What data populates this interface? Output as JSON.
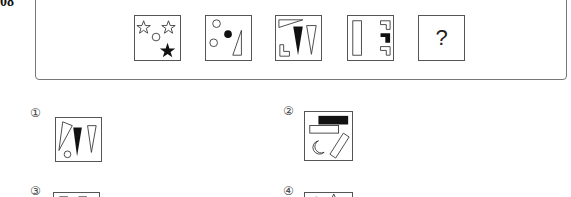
{
  "question": {
    "number": "08",
    "sequence": [
      {
        "id": 1,
        "description": "two outlined stars, one small circle, one filled star"
      },
      {
        "id": 2,
        "description": "two outlined circles, one filled circle, one outlined right triangle"
      },
      {
        "id": 3,
        "description": "outlined wedge triangle, filled tall triangle, outlined tall triangle, outlined L-shape"
      },
      {
        "id": 4,
        "description": "outlined tall rectangle, two outlined corner brackets, one filled corner bracket"
      },
      {
        "id": 5,
        "description": "unknown",
        "symbol": "?"
      }
    ]
  },
  "options": [
    {
      "label": "①",
      "description": "outlined wedge, filled tall triangle, outlined tall triangle, small circle"
    },
    {
      "label": "②",
      "description": "filled rectangle, outlined rectangle, outlined crescent moon, outlined slanted bar"
    },
    {
      "label": "③",
      "description": "partially visible: outlined squares"
    },
    {
      "label": "④",
      "description": "partially visible: filled circle and triangle"
    }
  ],
  "colors": {
    "stroke": "#333333",
    "fill": "#111111",
    "frame": "#777777"
  }
}
